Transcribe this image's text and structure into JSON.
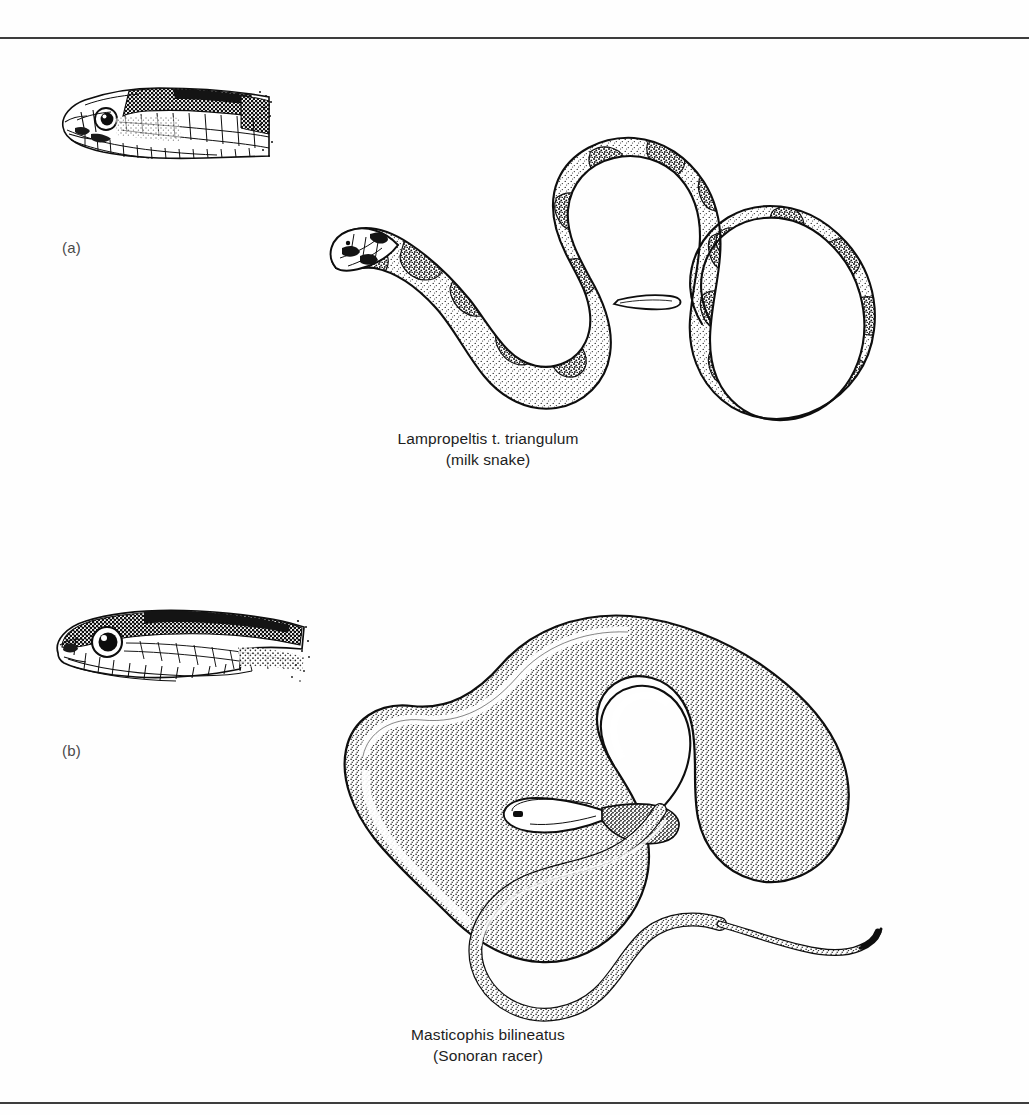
{
  "figure": {
    "kind": "scientific-illustration-plate",
    "background_color": "#fefefe",
    "ink_color": "#0e0e0e",
    "rule_color": "#3d3d3d",
    "top_rule_y": 37,
    "bottom_rule_y": 1102,
    "width": 1029,
    "height": 1115
  },
  "panels": [
    {
      "key": "a",
      "label": "(a)",
      "scientific_name": "Lampropeltis t. triangulum",
      "common_name": "(milk snake)",
      "head_detail": {
        "subject": "milk-snake-head",
        "orientation": "left-facing profile",
        "texture": "large plate scales with dark blotch markings and stipple shading"
      },
      "body": {
        "subject": "milk-snake-body",
        "pose": "serpentine S-curve with large terminal loop",
        "pattern": "dark-edged saddle blotches over stippled ground",
        "head_position": "lower-left, pointing down-left"
      }
    },
    {
      "key": "b",
      "label": "(b)",
      "scientific_name": "Masticophis bilineatus",
      "common_name": "(Sonoran racer)",
      "head_detail": {
        "subject": "sonoran-racer-head",
        "orientation": "left-facing profile",
        "texture": "large round eye, dark dorsum with pale labial scales"
      },
      "body": {
        "subject": "sonoran-racer-body",
        "pose": "broad open loop with inner spiral and long trailing tail",
        "pattern": "uniform fine stippling, no blotches",
        "head_position": "center of coil, pointing left"
      }
    }
  ]
}
